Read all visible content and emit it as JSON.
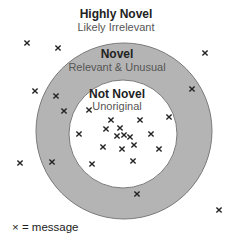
{
  "regions": {
    "outer": {
      "title": "Highly Novel",
      "subtitle": "Likely Irrelevant"
    },
    "middle": {
      "title": "Novel",
      "subtitle": "Relevant & Unusual"
    },
    "inner": {
      "title": "Not Novel",
      "subtitle": "Unoriginal"
    }
  },
  "legend": {
    "label": "× = message"
  },
  "colors": {
    "ring_fill": "#b4b4b4",
    "ring_stroke": "#7a7a7a",
    "inner_fill": "#ffffff",
    "marker": "#222222"
  },
  "geometry": {
    "outer_circle": {
      "cx": 124,
      "cy": 131,
      "r": 88
    },
    "inner_circle": {
      "cx": 123,
      "cy": 134,
      "r": 54
    }
  },
  "markers": [
    [
      27,
      43
    ],
    [
      58,
      48
    ],
    [
      205,
      53
    ],
    [
      35,
      91
    ],
    [
      56,
      96
    ],
    [
      192,
      89
    ],
    [
      64,
      111
    ],
    [
      89,
      110
    ],
    [
      169,
      117
    ],
    [
      111,
      120
    ],
    [
      140,
      120
    ],
    [
      106,
      129
    ],
    [
      120,
      128
    ],
    [
      79,
      134
    ],
    [
      117,
      136
    ],
    [
      124,
      135
    ],
    [
      130,
      137
    ],
    [
      151,
      134
    ],
    [
      103,
      147
    ],
    [
      122,
      149
    ],
    [
      134,
      145
    ],
    [
      159,
      149
    ],
    [
      52,
      162
    ],
    [
      92,
      164
    ],
    [
      133,
      161
    ],
    [
      137,
      194
    ],
    [
      20,
      163
    ],
    [
      219,
      210
    ]
  ]
}
